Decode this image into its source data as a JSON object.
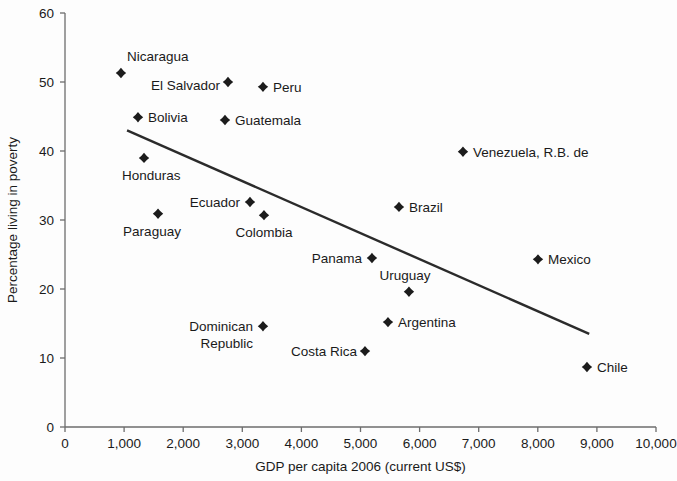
{
  "chart_data": {
    "type": "scatter",
    "title": "",
    "xlabel": "GDP per capita 2006 (current US$)",
    "ylabel": "Percentage living in poverty",
    "xlim": [
      0,
      10000
    ],
    "ylim": [
      0,
      60
    ],
    "xticks": [
      0,
      1000,
      2000,
      3000,
      4000,
      5000,
      6000,
      7000,
      8000,
      9000,
      10000
    ],
    "xtick_labels": [
      "0",
      "1,000",
      "2,000",
      "3,000",
      "4,000",
      "5,000",
      "6,000",
      "7,000",
      "8,000",
      "9,000",
      "10,000"
    ],
    "yticks": [
      0,
      10,
      20,
      30,
      40,
      50,
      60
    ],
    "ytick_labels": [
      "0",
      "10",
      "20",
      "30",
      "40",
      "50",
      "60"
    ],
    "grid": false,
    "legend": "none",
    "marker_shape": "diamond",
    "marker_color": "#1c1c1c",
    "trendline": {
      "present": true,
      "color": "#2b2b2b",
      "x_start": 1050,
      "y_start": 43.0,
      "x_end": 8870,
      "y_end": 13.5
    },
    "points": [
      {
        "label": "Nicaragua",
        "x": 947,
        "y": 51.3,
        "label_dx": 6,
        "label_dy": -12,
        "anchor": "start"
      },
      {
        "label": "El Salvador",
        "x": 2758,
        "y": 50.0,
        "label_dx": -8,
        "label_dy": 8,
        "anchor": "end"
      },
      {
        "label": "Peru",
        "x": 3350,
        "y": 49.3,
        "label_dx": 10,
        "label_dy": 5,
        "anchor": "start"
      },
      {
        "label": "Bolivia",
        "x": 1235,
        "y": 44.9,
        "label_dx": 10,
        "label_dy": 5,
        "anchor": "start"
      },
      {
        "label": "Guatemala",
        "x": 2707,
        "y": 44.5,
        "label_dx": 10,
        "label_dy": 5,
        "anchor": "start"
      },
      {
        "label": "Honduras",
        "x": 1337,
        "y": 39.0,
        "label_dx": -22,
        "label_dy": 22,
        "anchor": "start"
      },
      {
        "label": "Venezuela, R.B. de",
        "x": 6734,
        "y": 39.9,
        "label_dx": 10,
        "label_dy": 5,
        "anchor": "start"
      },
      {
        "label": "Ecuador",
        "x": 3130,
        "y": 32.6,
        "label_dx": -10,
        "label_dy": 5,
        "anchor": "end"
      },
      {
        "label": "Brazil",
        "x": 5651,
        "y": 31.9,
        "label_dx": 10,
        "label_dy": 5,
        "anchor": "start"
      },
      {
        "label": "Paraguay",
        "x": 1574,
        "y": 30.9,
        "label_dx": -6,
        "label_dy": 22,
        "anchor": "middle"
      },
      {
        "label": "Colombia",
        "x": 3367,
        "y": 30.7,
        "label_dx": 0,
        "label_dy": 22,
        "anchor": "middle"
      },
      {
        "label": "Panama",
        "x": 5194,
        "y": 24.5,
        "label_dx": -10,
        "label_dy": 5,
        "anchor": "end"
      },
      {
        "label": "Mexico",
        "x": 8003,
        "y": 24.3,
        "label_dx": 10,
        "label_dy": 5,
        "anchor": "start"
      },
      {
        "label": "Uruguay",
        "x": 5820,
        "y": 19.6,
        "label_dx": -4,
        "label_dy": -12,
        "anchor": "middle"
      },
      {
        "label": "Argentina",
        "x": 5465,
        "y": 15.2,
        "label_dx": 10,
        "label_dy": 5,
        "anchor": "start"
      },
      {
        "label": "Dominican",
        "x": 3350,
        "y": 14.6,
        "label_dx": -10,
        "label_dy": 5,
        "anchor": "end"
      },
      {
        "label": "Republic",
        "x": 3350,
        "y": 14.6,
        "label_dx": -10,
        "label_dy": 22,
        "anchor": "end",
        "label_only": true
      },
      {
        "label": "Costa Rica",
        "x": 5076,
        "y": 11.0,
        "label_dx": -8,
        "label_dy": 5,
        "anchor": "end"
      },
      {
        "label": "Chile",
        "x": 8832,
        "y": 8.7,
        "label_dx": 10,
        "label_dy": 5,
        "anchor": "start"
      }
    ]
  }
}
